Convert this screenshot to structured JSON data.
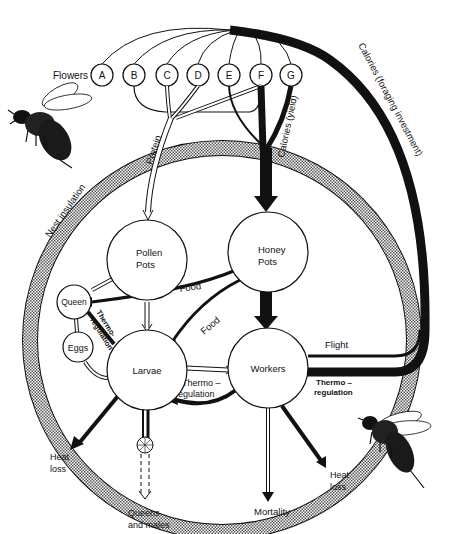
{
  "diagram": {
    "type": "bumblebee colony energy flow",
    "flowers_label": "Flowers",
    "flowers": [
      "A",
      "B",
      "C",
      "D",
      "E",
      "F",
      "G"
    ],
    "nodes": {
      "pollen_pots": [
        "Pollen",
        "Pots"
      ],
      "honey_pots": [
        "Honey",
        "Pots"
      ],
      "queen": "Queen",
      "eggs": "Eggs",
      "larvae": "Larvae",
      "workers": "Workers"
    },
    "flows": {
      "protein": "Protein",
      "calories_yield": "Calories (yield)",
      "calories_foraging": "Calories (foraging investment)",
      "nest_insulation": "Nest insulation",
      "food_queen": "Food",
      "food_larvae": "Food",
      "thermo_queen": [
        "Thermo-",
        "regulation"
      ],
      "thermo_larvae": [
        "Thermo –",
        "regulation"
      ],
      "thermo_workers": [
        "Thermo –",
        "regulation"
      ],
      "flight": "Flight",
      "heat_loss_left": [
        "Heat",
        "loss"
      ],
      "heat_loss_right": [
        "Heat",
        "loss"
      ],
      "queens_males": [
        "Queens",
        "and males"
      ],
      "mortality": "Mortality"
    },
    "colors": {
      "ink": "#111111",
      "hatch": "#8a8a8a",
      "paper": "#ffffff"
    }
  }
}
